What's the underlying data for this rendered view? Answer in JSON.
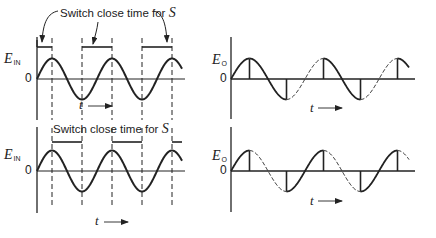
{
  "figure": {
    "panels": [
      {
        "id": "top-left",
        "y_label": "E",
        "y_label_sub": "IN",
        "zero_label": "0",
        "t_label": "t",
        "caption": "Switch close time for",
        "caption_var": "S",
        "description": "Input sinusoid with switch closed intervals from each peak to the following trough"
      },
      {
        "id": "top-right",
        "y_label": "E",
        "y_label_sub": "O",
        "zero_label": "0",
        "t_label": "t",
        "description": "Output follows falling half-cycles (solid), rising half-cycles dashed, vertical jumps at peaks and troughs"
      },
      {
        "id": "bottom-left",
        "y_label": "E",
        "y_label_sub": "IN",
        "zero_label": "0",
        "t_label": "t",
        "caption": "Switch close time for",
        "caption_var": "S",
        "description": "Input sinusoid with switch closed intervals from each trough to the following peak"
      },
      {
        "id": "bottom-right",
        "y_label": "E",
        "y_label_sub": "O",
        "zero_label": "0",
        "t_label": "t",
        "description": "Output follows rising half-cycles (solid), falling half-cycles dashed, vertical jumps at peaks and troughs"
      }
    ],
    "colors": {
      "ink": "#222222",
      "background": "#ffffff"
    }
  }
}
